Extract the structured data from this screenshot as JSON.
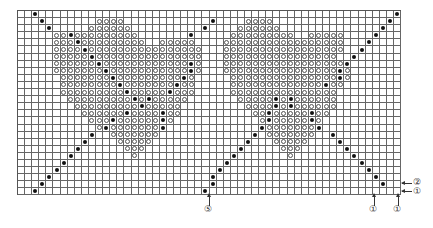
{
  "chart": {
    "title": "",
    "cols": 54,
    "rows": 26,
    "cell_px": 7.1,
    "legend_symbols": {
      ".": "empty",
      "o": "open-circle",
      "*": "filled-dot"
    },
    "grid_rows": [
      "..*..................................................*",
      "...*.......oooo............*....oooo................*.",
      "....*.....oooooo..........*....oooooo..............*..",
      ".....oo*ooooooooo.......*.....ooooooooo..ooooo....*...",
      ".....ooo*ooooooooo..ooooo....ooooooooooooooooo...*....",
      ".....oooo*oooooooooooooooo...ooooooooooooooooo..*.....",
      ".....ooooo*ooooooooooooooo...oooooooooooooooo..*......",
      ".....oooooo*oooooooooooo*o...ooooooooooooooooo*.......",
      ".....ooooooo*ooooooooooo*o...oooooooooooooooo*o.......",
      "......ooooooo*ooooooooo*o.....ooooooooooooooo*o.......",
      "......oooooooo*ooooooo*oo.....ooooooooooooo*oo........",
      "......ooooooooo*ooooo*ooo.....ooooooooooooooo.........",
      ".......ooooooooo*o*ooooo.......ooooo*o*oooooo.........",
      "........ooooooooo*ooooo.........oooo*o*oooooo.........",
      ".........oooooo*oooo*oo..........oo*ooooo*oo..........",
      "..........ooo*oooooo*o............o*ooooo*o...........",
      "...........o*ooooooo*.............*ooooooo*...........",
      "..........*..ooooooo.............*.ooooooo..*.........",
      ".........*....ooooo.............*...ooooo....*........",
      "........*......ooo.............*.....ooo......*.......",
      ".......*........o.............*.......o........*......",
      "......*......................*..................*.....",
      ".....*......................*....................*....",
      "....*......................*......................*...",
      "...*.......................*.......................*.",
      "..*.......................*.........................."
    ]
  },
  "markers": [
    {
      "label": "⑤",
      "position": "bottom",
      "col": 27
    },
    {
      "label": "①",
      "position": "bottom",
      "col": 50
    },
    {
      "label": "①",
      "position": "bottom",
      "col": 53
    },
    {
      "label": "②",
      "position": "right",
      "row": 24
    },
    {
      "label": "①",
      "position": "right",
      "row": 25
    }
  ]
}
